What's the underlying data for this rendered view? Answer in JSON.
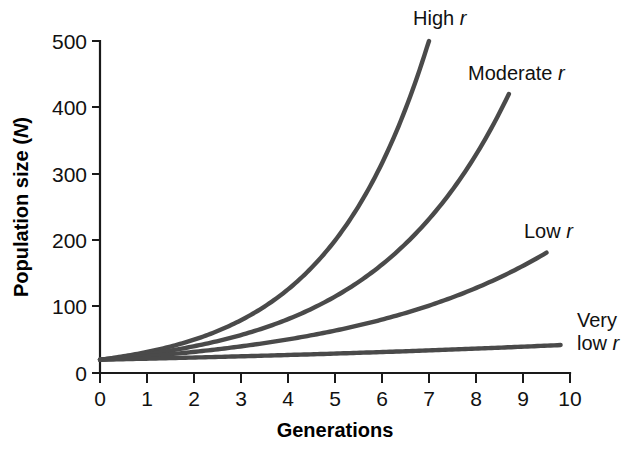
{
  "chart_data": {
    "type": "line",
    "title": "",
    "xlabel": "Generations",
    "ylabel": "Population size (N)",
    "ylabel_text": "Population size",
    "ylabel_symbol": "N",
    "xlim": [
      0,
      10
    ],
    "ylim": [
      0,
      500
    ],
    "xticks": [
      "0",
      "1",
      "2",
      "3",
      "4",
      "5",
      "6",
      "7",
      "8",
      "9",
      "10"
    ],
    "yticks": [
      "0",
      "100",
      "200",
      "300",
      "400",
      "500"
    ],
    "grid": false,
    "legend_position": "inline-end-of-curve",
    "initial_population": 20,
    "series": [
      {
        "name": "High r",
        "label_prefix": "High",
        "label_symbol": "r",
        "growth_rate": 0.46,
        "color": "#4a4a4a",
        "x": [
          0,
          0.5,
          1,
          1.5,
          2,
          2.5,
          3,
          3.5,
          4,
          4.5,
          5,
          5.5,
          6,
          6.5,
          7
        ],
        "values": [
          20,
          25,
          32,
          40,
          50,
          63,
          79,
          100,
          126,
          159,
          200,
          251,
          316,
          398,
          500
        ]
      },
      {
        "name": "Moderate r",
        "label_prefix": "Moderate",
        "label_symbol": "r",
        "growth_rate": 0.35,
        "color": "#4a4a4a",
        "x": [
          0,
          0.7,
          1.4,
          2.1,
          2.8,
          3.5,
          4.2,
          4.9,
          5.6,
          6.3,
          7.0,
          7.7,
          8.4,
          8.7
        ],
        "values": [
          20,
          26,
          33,
          42,
          53,
          68,
          87,
          111,
          142,
          181,
          231,
          295,
          377,
          418
        ]
      },
      {
        "name": "Low r",
        "label_prefix": "Low",
        "label_symbol": "r",
        "growth_rate": 0.232,
        "color": "#4a4a4a",
        "x": [
          0,
          0.8,
          1.6,
          2.4,
          3.2,
          4.0,
          4.8,
          5.6,
          6.4,
          7.2,
          8.0,
          8.8,
          9.5
        ],
        "values": [
          20,
          24,
          29,
          35,
          42,
          51,
          61,
          73,
          88,
          106,
          128,
          154,
          181
        ]
      },
      {
        "name": "Very low r",
        "label_prefix": "Very low",
        "label_symbol": "r",
        "growth_rate": 0.076,
        "color": "#4a4a4a",
        "x": [
          0,
          1,
          2,
          3,
          4,
          5,
          6,
          7,
          8,
          9,
          9.8
        ],
        "values": [
          20,
          22,
          23,
          25,
          27,
          29,
          32,
          34,
          37,
          40,
          42
        ]
      }
    ],
    "annotations": [
      {
        "id": "high-r",
        "text_line1": "High",
        "symbol": "r",
        "x_px": 413,
        "y_px": 25
      },
      {
        "id": "moderate-r",
        "text_line1": "Moderate",
        "symbol": "r",
        "x_px": 468,
        "y_px": 80
      },
      {
        "id": "low-r",
        "text_line1": "Low",
        "symbol": "r",
        "x_px": 524,
        "y_px": 238
      },
      {
        "id": "very-low-r",
        "text_line1": "Very",
        "text_line2": "low",
        "symbol": "r",
        "x_px": 577,
        "y_px": 327
      }
    ]
  }
}
